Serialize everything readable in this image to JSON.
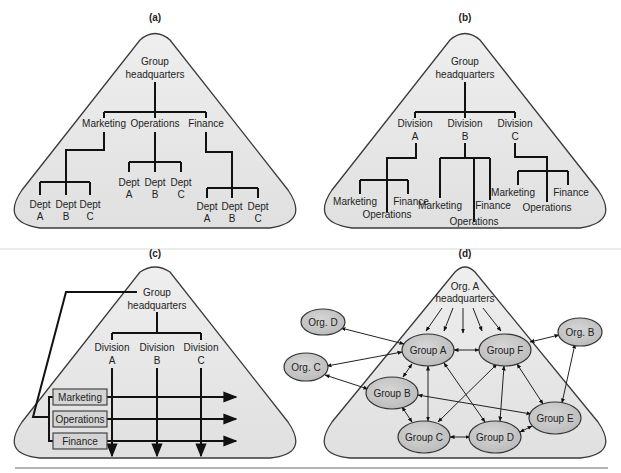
{
  "panels": {
    "a": {
      "title": "(a)",
      "root": [
        "Group",
        "headquarters"
      ],
      "functions": [
        "Marketing",
        "Operations",
        "Finance"
      ],
      "depts": {
        "marketing": [
          [
            "Dept",
            "A"
          ],
          [
            "Dept",
            "B"
          ],
          [
            "Dept",
            "C"
          ]
        ],
        "operations": [
          [
            "Dept",
            "A"
          ],
          [
            "Dept",
            "B"
          ],
          [
            "Dept",
            "C"
          ]
        ],
        "finance": [
          [
            "Dept",
            "A"
          ],
          [
            "Dept",
            "B"
          ],
          [
            "Dept",
            "C"
          ]
        ]
      }
    },
    "b": {
      "title": "(b)",
      "root": [
        "Group",
        "headquarters"
      ],
      "divisions": [
        [
          "Division",
          "A"
        ],
        [
          "Division",
          "B"
        ],
        [
          "Division",
          "C"
        ]
      ],
      "sub_functions": [
        "Marketing",
        "Operations",
        "Finance"
      ]
    },
    "c": {
      "title": "(c)",
      "root": [
        "Group",
        "headquarters"
      ],
      "divisions": [
        [
          "Division",
          "A"
        ],
        [
          "Division",
          "B"
        ],
        [
          "Division",
          "C"
        ]
      ],
      "function_boxes": [
        "Marketing",
        "Operations",
        "Finance"
      ]
    },
    "d": {
      "title": "(d)",
      "root": [
        "Org. A",
        "headquarters"
      ],
      "internal_groups": [
        "Group A",
        "Group B",
        "Group C",
        "Group D",
        "Group E",
        "Group F"
      ],
      "external_orgs": [
        "Org. B",
        "Org. C",
        "Org. D"
      ],
      "links": [
        [
          "Org. D",
          "Group A"
        ],
        [
          "Org. C",
          "Group A"
        ],
        [
          "Org. C",
          "Group B"
        ],
        [
          "Org. B",
          "Group F"
        ],
        [
          "Org. B",
          "Group E"
        ],
        [
          "Group A",
          "Group F"
        ],
        [
          "Group A",
          "Group B"
        ],
        [
          "Group A",
          "Group C"
        ],
        [
          "Group A",
          "Group D"
        ],
        [
          "Group F",
          "Group C"
        ],
        [
          "Group F",
          "Group D"
        ],
        [
          "Group F",
          "Group E"
        ],
        [
          "Group B",
          "Group C"
        ],
        [
          "Group B",
          "Group E"
        ],
        [
          "Group C",
          "Group D"
        ],
        [
          "Group D",
          "Group E"
        ]
      ]
    }
  },
  "colors": {
    "triangle_fill": "#e6e6e6",
    "node_fill": "#c8c8c8",
    "box_fill": "#d4d4d4",
    "line": "#111111"
  }
}
